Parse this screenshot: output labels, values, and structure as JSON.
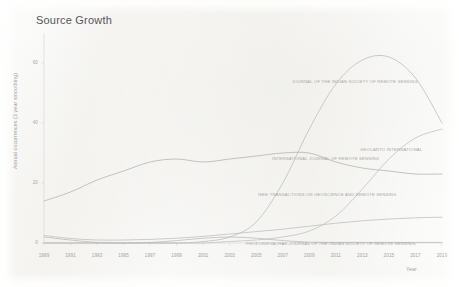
{
  "chart_data": {
    "type": "line",
    "title": "Source Growth",
    "xlabel": "Year",
    "ylabel": "Annual occurrences (3 year smoothing)",
    "grid": false,
    "legend_position": "inline-annotations",
    "xlim": [
      1989,
      2019
    ],
    "ylim": [
      0,
      70
    ],
    "yticks": [
      "0",
      "20",
      "40",
      "60"
    ],
    "ytick_values": [
      0,
      20,
      40,
      60
    ],
    "x": [
      1989,
      1991,
      1993,
      1995,
      1997,
      1999,
      2001,
      2003,
      2005,
      2007,
      2009,
      2011,
      2013,
      2015,
      2017,
      2019
    ],
    "xticks": [
      "1989",
      "1991",
      "1993",
      "1995",
      "1997",
      "1999",
      "2001",
      "2003",
      "2005",
      "2007",
      "2009",
      "2011",
      "2013",
      "2015",
      "2017",
      "2019"
    ],
    "series": [
      {
        "name": "JOURNAL OF THE INDIAN SOCIETY OF REMOTE SENSING",
        "label": "JOURNAL OF THE INDIAN SOCIETY OF REMOTE SENSING",
        "color": "#b9b9bb",
        "values": [
          0,
          0,
          0,
          0,
          0,
          0,
          0.5,
          2,
          7,
          20,
          38,
          53,
          61,
          62,
          55,
          40
        ]
      },
      {
        "name": "GEOCARTO INTERNATIONAL",
        "label": "GEOCARTO INTERNATIONAL",
        "color": "#bdbdbf",
        "values": [
          0,
          0,
          0,
          0,
          0,
          0,
          0,
          0.5,
          1,
          2,
          4,
          9,
          18,
          28,
          35,
          38
        ]
      },
      {
        "name": "INTERNATIONAL JOURNAL OF REMOTE SENSING",
        "label": "INTERNATIONAL JOURNAL OF REMOTE SENSING",
        "color": "#b0b0b2",
        "values": [
          14,
          17,
          21,
          24,
          27,
          28,
          27,
          28,
          29,
          30,
          30,
          27,
          25,
          24,
          23,
          23
        ]
      },
      {
        "name": "IEEE TRANSACTIONS ON GEOSCIENCE AND REMOTE SENSING",
        "label": "IEEE TRANSACTIONS ON GEOSCIENCE AND REMOTE SENSING",
        "color": "#bcbcbe",
        "values": [
          2.5,
          1.5,
          1.0,
          1.0,
          1.2,
          1.6,
          2.2,
          3.0,
          3.8,
          4.6,
          5.6,
          6.6,
          7.4,
          8.0,
          8.4,
          8.6
        ]
      },
      {
        "name": "PHOTONIRVACHAK-JOURNAL OF THE INDIAN SOCIETY OF REMOTE SENSING",
        "label": "PHOTONIRVACHAK-JOURNAL OF THE INDIAN SOCIETY OF REMOTE SENSING",
        "color": "#b8b8ba",
        "values": [
          2.0,
          1.0,
          0.2,
          0.0,
          0.2,
          0.8,
          1.6,
          2.0,
          1.6,
          0.8,
          0.3,
          0.2,
          0.2,
          0.2,
          0.2,
          0.2
        ]
      }
    ],
    "annotations": [
      {
        "text": "JOURNAL OF THE INDIAN SOCIETY OF REMOTE SENSING",
        "x": 292,
        "y": 79
      },
      {
        "text": "GEOCARTO INTERNATIONAL",
        "x": 360,
        "y": 147
      },
      {
        "text": "INTERNATIONAL JOURNAL OF REMOTE SENSING",
        "x": 272,
        "y": 156
      },
      {
        "text": "IEEE TRANSACTIONS ON GEOSCIENCE AND REMOTE SENSING",
        "x": 258,
        "y": 192
      },
      {
        "text": "PHOTONIRVACHAK-JOURNAL OF THE INDIAN SOCIETY OF REMOTE SENSING",
        "x": 246,
        "y": 241
      }
    ]
  }
}
